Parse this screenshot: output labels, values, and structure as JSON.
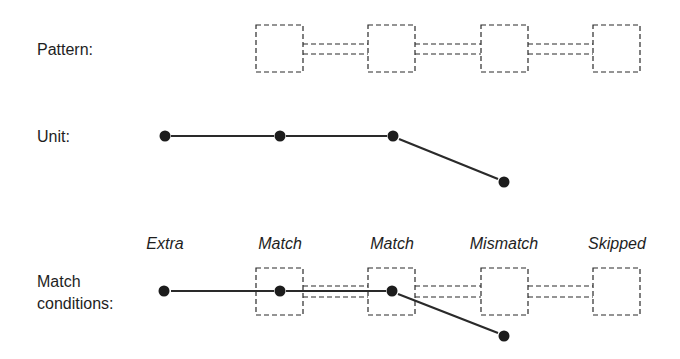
{
  "rows": {
    "pattern": {
      "label": "Pattern:"
    },
    "unit": {
      "label": "Unit:"
    },
    "match_conditions": {
      "label_line1": "Match",
      "label_line2": "conditions:"
    }
  },
  "conditions": [
    {
      "label": "Extra",
      "x": 165
    },
    {
      "label": "Match",
      "x": 280
    },
    {
      "label": "Match",
      "x": 392
    },
    {
      "label": "Mismatch",
      "x": 504
    },
    {
      "label": "Skipped",
      "x": 617
    }
  ],
  "colors": {
    "stroke": "#2a2a2a",
    "dot": "#1c1c1c",
    "background": "#ffffff"
  }
}
